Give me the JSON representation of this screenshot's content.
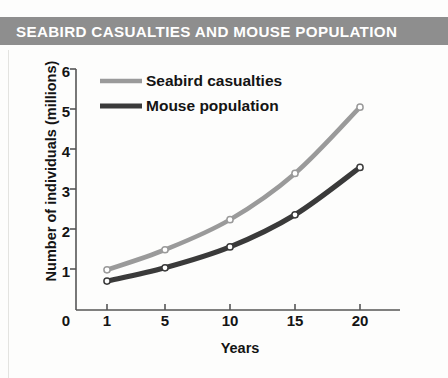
{
  "banner": {
    "title": "SEABIRD CASUALTIES AND MOUSE POPULATION",
    "background_color": "#8e8e8e",
    "text_color": "#ffffff"
  },
  "chart_data": {
    "type": "line",
    "title": "SEABIRD CASUALTIES AND MOUSE POPULATION",
    "xlabel": "Years",
    "ylabel": "Number of individuals (millions)",
    "x": [
      1,
      5,
      10,
      15,
      20
    ],
    "xtick_labels": [
      "1",
      "5",
      "10",
      "15",
      "20"
    ],
    "x_origin_label": "0",
    "ytick_labels": [
      "0",
      "1",
      "2",
      "3",
      "4",
      "5",
      "6"
    ],
    "xlim": [
      0,
      22
    ],
    "ylim": [
      0,
      6
    ],
    "grid": false,
    "legend_position": "top-left-inside",
    "markers": "open-circle",
    "series": [
      {
        "name": "Seabird casualties",
        "values": [
          1.0,
          1.5,
          2.25,
          3.4,
          5.05
        ],
        "color": "#9a9a9a"
      },
      {
        "name": "Mouse population",
        "values": [
          0.72,
          1.05,
          1.57,
          2.37,
          3.55
        ],
        "color": "#3a3a3a"
      }
    ]
  }
}
